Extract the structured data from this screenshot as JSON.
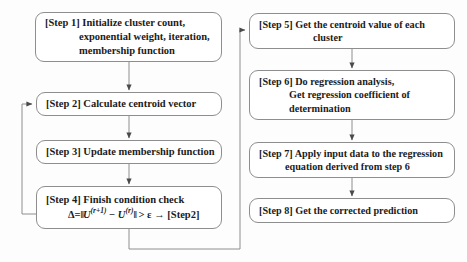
{
  "diagram": {
    "type": "flowchart",
    "orientation": "two-column, top-to-bottom",
    "stroke_color": "#8e8e8e",
    "text_color": "#1b1b1b",
    "background_color": "#fdfdfd"
  },
  "nodes": [
    {
      "id": "step1",
      "label": "[Step 1]",
      "lines": [
        "[Step 1] Initialize cluster count,",
        "exponential weight, iteration,",
        "membership function"
      ]
    },
    {
      "id": "step2",
      "label": "[Step 2]",
      "lines": [
        "[Step 2] Calculate centroid vector"
      ]
    },
    {
      "id": "step3",
      "label": "[Step 3]",
      "lines": [
        "[Step 3] Update membership function"
      ]
    },
    {
      "id": "step4",
      "label": "[Step 4]",
      "lines": [
        "[Step 4] Finish condition check"
      ],
      "formula": {
        "delta": "Δ=",
        "norm_open": "‖",
        "u_next": "U",
        "sup_next": "(r+1)",
        "minus": "−",
        "u_cur": "U",
        "sup_cur": "(r)",
        "norm_close": "‖",
        "compare": "> ε",
        "arrow": "→",
        "target": "[Step2]",
        "plain": "Δ= ‖U(r+1) − U(r)‖ > ε → [Step2]"
      }
    },
    {
      "id": "step5",
      "label": "[Step 5]",
      "lines": [
        "[Step 5] Get the centroid value of each",
        "cluster"
      ]
    },
    {
      "id": "step6",
      "label": "[Step 6]",
      "lines": [
        "[Step 6] Do regression analysis,",
        "Get regression coefficient of",
        "determination"
      ]
    },
    {
      "id": "step7",
      "label": "[Step 7]",
      "lines": [
        "[Step 7] Apply input data to the regression",
        "equation derived from step 6"
      ]
    },
    {
      "id": "step8",
      "label": "[Step 8]",
      "lines": [
        "[Step 8] Get the corrected prediction"
      ]
    }
  ],
  "edges": [
    {
      "id": "e1",
      "from": "step1",
      "to": "step2",
      "kind": "straight-down",
      "arrow": true
    },
    {
      "id": "e2",
      "from": "step2",
      "to": "step3",
      "kind": "straight-down",
      "arrow": true
    },
    {
      "id": "e3",
      "from": "step3",
      "to": "step4",
      "kind": "straight-down",
      "arrow": true
    },
    {
      "id": "e4",
      "from": "step4",
      "to": "step2",
      "kind": "feedback-loop-left",
      "arrow": true
    },
    {
      "id": "e5",
      "from": "step4",
      "to": "step5",
      "kind": "route-down-right-up",
      "arrow": true
    },
    {
      "id": "e6",
      "from": "step5",
      "to": "step6",
      "kind": "straight-down",
      "arrow": true
    },
    {
      "id": "e7",
      "from": "step6",
      "to": "step7",
      "kind": "straight-down",
      "arrow": true
    },
    {
      "id": "e8",
      "from": "step7",
      "to": "step8",
      "kind": "straight-down",
      "arrow": true
    }
  ]
}
